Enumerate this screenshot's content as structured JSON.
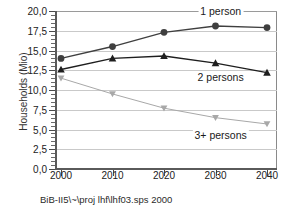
{
  "chart_data": {
    "type": "line",
    "title": "",
    "xlabel": "",
    "ylabel": "Households (Mio)",
    "categories": [
      "2000",
      "2010",
      "2020",
      "2030",
      "2040"
    ],
    "x": [
      2000,
      2010,
      2020,
      2030,
      2040
    ],
    "ylim": [
      0.0,
      20.0
    ],
    "ytick_labels": [
      "0,0",
      "2,5",
      "5,0",
      "7,5",
      "10,0",
      "12,5",
      "15,0",
      "17,5",
      "20,0"
    ],
    "ytick_values": [
      0.0,
      2.5,
      5.0,
      7.5,
      10.0,
      12.5,
      15.0,
      17.5,
      20.0
    ],
    "grid": true,
    "legend_position": "inline-annotations",
    "series": [
      {
        "name": "1 person",
        "marker": "circle",
        "color": "#3f3f3f",
        "values": [
          14.0,
          15.5,
          17.3,
          18.1,
          17.9
        ]
      },
      {
        "name": "2 persons",
        "marker": "triangle-up",
        "color": "#1e1e1e",
        "values": [
          12.6,
          14.0,
          14.3,
          13.4,
          12.2
        ]
      },
      {
        "name": "3+ persons",
        "marker": "triangle-down",
        "color": "#a8a8a8",
        "values": [
          11.5,
          9.5,
          7.7,
          6.5,
          5.7
        ]
      }
    ],
    "annotations": [
      {
        "text": "1 person",
        "x": 2031,
        "y": 20.0
      },
      {
        "text": "2 persons",
        "x": 2031,
        "y": 11.6
      },
      {
        "text": "3+ persons",
        "x": 2031,
        "y": 4.3
      }
    ]
  },
  "footer": {
    "source_text": "BiB-II5\\~\\proj  lhf\\lhf03.sps  2000"
  },
  "colors": {
    "series_1_person": "#3f3f3f",
    "series_2_persons": "#1e1e1e",
    "series_3plus_persons": "#a8a8a8",
    "gridline": "#c9c9c9",
    "axis": "#5a5a5a",
    "background": "#ffffff"
  }
}
